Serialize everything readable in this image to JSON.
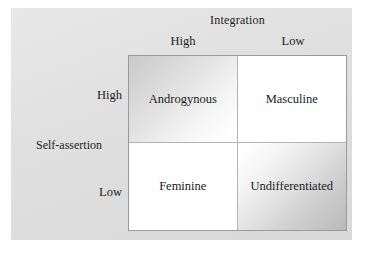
{
  "figure": {
    "column_axis_title": "Integration",
    "row_axis_title": "Self-assertion",
    "column_labels": [
      "High",
      "Low"
    ],
    "row_labels": [
      "High",
      "Low"
    ],
    "cells": [
      {
        "label": "Androgynous",
        "row": "High",
        "column": "High"
      },
      {
        "label": "Masculine",
        "row": "High",
        "column": "Low"
      },
      {
        "label": "Feminine",
        "row": "Low",
        "column": "High"
      },
      {
        "label": "Undifferentiated",
        "row": "Low",
        "column": "Low"
      }
    ],
    "colors": {
      "panel_background": "#e1e1e1",
      "page_background": "#ffffff",
      "matrix_border": "#9a9a9a",
      "text": "#1d1d1d"
    }
  }
}
